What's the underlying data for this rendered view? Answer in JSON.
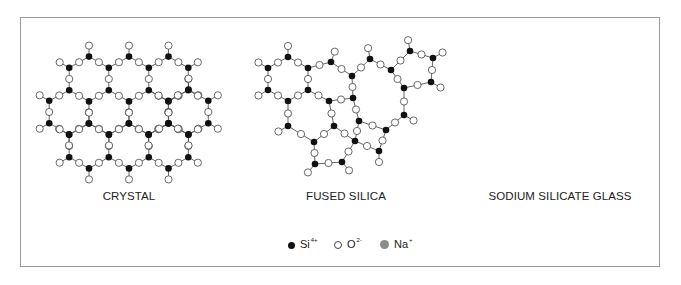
{
  "figure": {
    "panels": [
      {
        "id": "crystal",
        "label": "CRYSTAL"
      },
      {
        "id": "fused-silica",
        "label": "FUSED SILICA"
      },
      {
        "id": "sodium-silicate-glass",
        "label": "SODIUM SILICATE GLASS"
      }
    ],
    "legend": [
      {
        "id": "silicon",
        "symbol": "Si",
        "charge": "4+",
        "marker": "filled-black-dot"
      },
      {
        "id": "oxygen",
        "symbol": "O",
        "charge": "2-",
        "marker": "open-circle"
      },
      {
        "id": "sodium",
        "symbol": "Na",
        "charge": "+",
        "marker": "filled-gray-dot"
      }
    ],
    "colors": {
      "silicon": "#111111",
      "oxygen_fill": "#ffffff",
      "oxygen_stroke": "#444444",
      "sodium": "#8c8c8c",
      "bond": "#555555",
      "frame": "#9a9a9a"
    }
  }
}
